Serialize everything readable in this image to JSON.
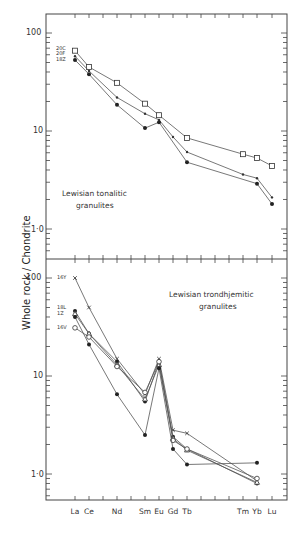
{
  "chart_data": [
    {
      "type": "line",
      "panel": "top",
      "title": "Lewisian tonalitic granulites",
      "ylabel": "Whole rock / Chondrite",
      "yscale": "log",
      "ylim": [
        0.5,
        100
      ],
      "yticks": [
        "100",
        "10",
        "1·0"
      ],
      "categories": [
        "La",
        "Ce",
        "Nd",
        "Sm",
        "Eu",
        "Gd",
        "Tb",
        "Tm",
        "Yb",
        "Lu"
      ],
      "series": [
        {
          "name": "20C",
          "marker": "open-square",
          "x": [
            "La",
            "Ce",
            "Nd",
            "Sm",
            "Eu",
            "Tb",
            "Tm",
            "Yb",
            "Lu"
          ],
          "values": [
            66,
            45,
            31,
            19,
            14.5,
            8.5,
            5.8,
            5.3,
            4.4
          ]
        },
        {
          "name": "20F",
          "marker": "small-dot",
          "x": [
            "La",
            "Ce",
            "Nd",
            "Sm",
            "Eu",
            "Gd",
            "Tb",
            "Tm",
            "Yb",
            "Lu"
          ],
          "values": [
            58,
            41,
            22,
            15,
            13,
            8.7,
            6.1,
            3.6,
            3.3,
            2.1
          ]
        },
        {
          "name": "18Z",
          "marker": "filled-circle",
          "x": [
            "La",
            "Ce",
            "Nd",
            "Sm",
            "Eu",
            "Tb",
            "Yb",
            "Lu"
          ],
          "values": [
            53,
            38,
            18.5,
            10.7,
            12.3,
            4.8,
            2.9,
            1.8
          ]
        }
      ]
    },
    {
      "type": "line",
      "panel": "bottom",
      "title": "Lewisian trondhjemitic granulites",
      "ylabel": "Whole rock / Chondrite",
      "yscale": "log",
      "ylim": [
        0.6,
        100
      ],
      "yticks": [
        "100",
        "10",
        "1·0"
      ],
      "categories": [
        "La",
        "Ce",
        "Nd",
        "Sm",
        "Eu",
        "Gd",
        "Tb",
        "Tm",
        "Yb",
        "Lu"
      ],
      "series": [
        {
          "name": "16Y",
          "marker": "cross",
          "x": [
            "La",
            "Ce",
            "Nd",
            "Sm",
            "Eu",
            "Gd",
            "Tb",
            "Yb"
          ],
          "values": [
            100,
            50,
            15,
            6.5,
            15,
            2.8,
            2.6,
            0.85
          ]
        },
        {
          "name": "18L",
          "marker": "filled-circle",
          "x": [
            "La",
            "Ce",
            "Nd",
            "Sm",
            "Eu",
            "Gd",
            "Tb",
            "Yb"
          ],
          "values": [
            46,
            27,
            14,
            5.5,
            14,
            2.4,
            1.8,
            0.8
          ]
        },
        {
          "name": "1Z",
          "marker": "open-triangle",
          "x": [
            "La",
            "Ce",
            "Nd",
            "Sm",
            "Eu",
            "Gd",
            "Tb",
            "Yb"
          ],
          "values": [
            43,
            27,
            13,
            5.8,
            13,
            2.3,
            1.75,
            0.82
          ]
        },
        {
          "name": "16V",
          "marker": "open-circle",
          "x": [
            "La",
            "Ce",
            "Nd",
            "Sm",
            "Eu",
            "Gd",
            "Tb",
            "Yb"
          ],
          "values": [
            31,
            25,
            12.5,
            6.8,
            14,
            2.2,
            1.8,
            0.9
          ]
        },
        {
          "name": "unlabeled",
          "marker": "filled-circle",
          "x": [
            "La",
            "Ce",
            "Nd",
            "Sm",
            "Eu",
            "Gd",
            "Tb",
            "Yb"
          ],
          "values": [
            40,
            21,
            6.5,
            2.5,
            12,
            1.8,
            1.25,
            1.3
          ]
        }
      ]
    }
  ],
  "labels": {
    "y_title": "Whole rock / Chondrite",
    "top_panel_line1": "Lewisian tonalitic",
    "top_panel_line2": "granulites",
    "bottom_panel_line1": "Lewisian trondhjemitic",
    "bottom_panel_line2": "granulites",
    "top_series_labels": [
      "20C",
      "20F",
      "18Z"
    ],
    "bottom_series_labels": [
      "16Y",
      "18L",
      "1Z",
      "16V"
    ],
    "y_ticks": [
      "100",
      "10",
      "1·0"
    ],
    "x_ticks": [
      "La",
      "Ce",
      "Nd",
      "Sm",
      "Eu",
      "Gd",
      "Tb",
      "Tm",
      "Yb",
      "Lu"
    ]
  }
}
